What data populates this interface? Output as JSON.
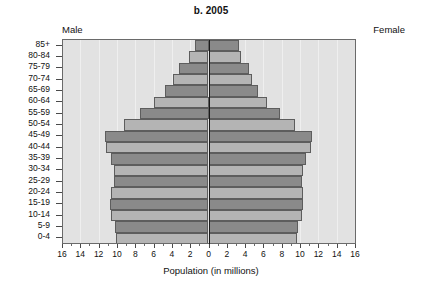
{
  "chart_data": {
    "type": "bar",
    "subtype": "population-pyramid",
    "title": "b. 2005",
    "xlabel": "Population (in millions)",
    "ylabel": "",
    "xlim": [
      -16,
      16
    ],
    "xticks": [
      16,
      14,
      12,
      10,
      8,
      6,
      4,
      2,
      0,
      2,
      4,
      6,
      8,
      10,
      12,
      14,
      16
    ],
    "grid": true,
    "legend_position": "none",
    "side_labels": {
      "left": "Male",
      "right": "Female"
    },
    "categories": [
      "85+",
      "80-84",
      "75-79",
      "70-74",
      "65-69",
      "60-64",
      "55-59",
      "50-54",
      "45-49",
      "40-44",
      "35-39",
      "30-34",
      "25-29",
      "20-24",
      "15-19",
      "10-14",
      "5-9",
      "0-4"
    ],
    "series": [
      {
        "name": "Male",
        "direction": "left",
        "values": [
          1.5,
          2.1,
          3.2,
          3.9,
          4.8,
          6.0,
          7.5,
          9.2,
          11.3,
          11.2,
          10.6,
          10.3,
          10.3,
          10.6,
          10.8,
          10.7,
          10.2,
          10.1
        ]
      },
      {
        "name": "Female",
        "direction": "right",
        "values": [
          3.3,
          3.5,
          4.4,
          4.8,
          5.4,
          6.4,
          7.8,
          9.4,
          11.3,
          11.2,
          10.6,
          10.3,
          10.2,
          10.3,
          10.3,
          10.2,
          9.8,
          9.7
        ]
      }
    ],
    "bar_fill_alternation": [
      "light",
      "dark"
    ],
    "colors": {
      "bar_light": "#b4b4b4",
      "bar_dark": "#8a8a8a",
      "bar_edge": "#5d5d5d",
      "plot_background": "#e2e2e2",
      "center_axis": "#1a1a1a",
      "gridline": "#efefef",
      "text": "#111111"
    }
  }
}
